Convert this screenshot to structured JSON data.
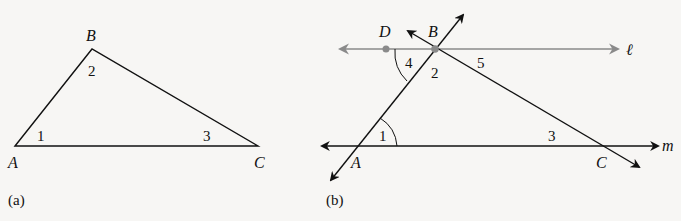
{
  "figure_a": {
    "caption": "(a)",
    "vertices": {
      "A": "A",
      "B": "B",
      "C": "C"
    },
    "angles": {
      "a1": "1",
      "a2": "2",
      "a3": "3"
    }
  },
  "figure_b": {
    "caption": "(b)",
    "points": {
      "A": "A",
      "B": "B",
      "C": "C",
      "D": "D"
    },
    "lines": {
      "l": "ℓ",
      "m": "m"
    },
    "angles": {
      "a1": "1",
      "a2": "2",
      "a3": "3",
      "a4": "4",
      "a5": "5"
    }
  },
  "colors": {
    "ink": "#111111",
    "gray_line": "#8a8a8a",
    "background": "#f7f6f4"
  }
}
